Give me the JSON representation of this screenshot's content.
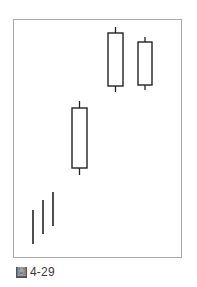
{
  "figure": {
    "caption_mark": "圖",
    "caption_number": "4-29",
    "frame_color": "#a8a8a8",
    "line_color": "#222222"
  },
  "chart_data": {
    "type": "candlestick",
    "title": "",
    "xlabel": "",
    "ylabel": "",
    "grid": false,
    "legend": null,
    "axes_visible": false,
    "y_coordinate_note": "values are relative price levels (higher = higher price), unitless, estimated from pixel positions",
    "ylim": [
      0,
      100
    ],
    "series": [
      {
        "name": "bar-1",
        "kind": "line",
        "x": 1,
        "high": 20,
        "low": 6,
        "open": null,
        "close": null
      },
      {
        "name": "bar-2",
        "kind": "line",
        "x": 2,
        "high": 24,
        "low": 10,
        "open": null,
        "close": null
      },
      {
        "name": "bar-3",
        "kind": "line",
        "x": 3,
        "high": 28,
        "low": 14,
        "open": null,
        "close": null
      },
      {
        "name": "candle-4",
        "kind": "candle",
        "filled": false,
        "x": 4,
        "high": 62,
        "low": 35,
        "body_top": 59,
        "body_bottom": 38
      },
      {
        "name": "candle-5",
        "kind": "candle",
        "filled": false,
        "x": 5,
        "high": 94,
        "low": 71,
        "body_top": 92,
        "body_bottom": 73
      },
      {
        "name": "candle-6",
        "kind": "candle",
        "filled": false,
        "x": 6,
        "high": 90,
        "low": 72,
        "body_top": 88,
        "body_bottom": 74
      }
    ],
    "pixel_geometry": [
      {
        "name": "bar-1",
        "cx": 33,
        "y_top": 210,
        "y_bottom": 244
      },
      {
        "name": "bar-2",
        "cx": 43,
        "y_top": 200,
        "y_bottom": 234
      },
      {
        "name": "bar-3",
        "cx": 53,
        "y_top": 192,
        "y_bottom": 226
      },
      {
        "name": "candle-4",
        "cx": 79.5,
        "x_left": 72,
        "x_right": 87,
        "wick_top": 101,
        "body_top": 108,
        "body_bottom": 168,
        "wick_bottom": 175
      },
      {
        "name": "candle-5",
        "cx": 115.5,
        "x_left": 108,
        "x_right": 123,
        "wick_top": 27,
        "body_top": 33,
        "body_bottom": 86,
        "wick_bottom": 92
      },
      {
        "name": "candle-6",
        "cx": 145,
        "x_left": 138,
        "x_right": 152,
        "wick_top": 37,
        "body_top": 42,
        "body_bottom": 85,
        "wick_bottom": 90
      }
    ]
  }
}
